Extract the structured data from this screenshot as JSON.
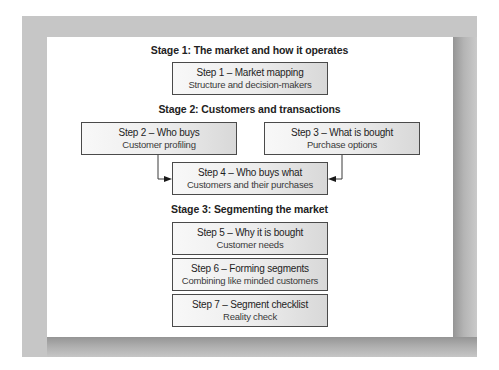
{
  "diagram": {
    "stages": [
      {
        "heading": "Stage 1:  The market and how it operates",
        "steps": [
          {
            "title": "Step 1 – Market mapping",
            "subtitle": "Structure and decision-makers"
          }
        ]
      },
      {
        "heading": "Stage 2:  Customers and transactions",
        "steps": [
          {
            "title": "Step 2 – Who buys",
            "subtitle": "Customer profiling"
          },
          {
            "title": "Step 3 – What is bought",
            "subtitle": "Purchase options"
          },
          {
            "title": "Step 4 – Who buys what",
            "subtitle": "Customers and their purchases"
          }
        ]
      },
      {
        "heading": "Stage 3:  Segmenting the market",
        "steps": [
          {
            "title": "Step 5 – Why it is bought",
            "subtitle": "Customer needs"
          },
          {
            "title": "Step 6 – Forming segments",
            "subtitle": "Combining like minded customers"
          },
          {
            "title": "Step 7 – Segment checklist",
            "subtitle": "Reality check"
          }
        ]
      }
    ],
    "connections": [
      {
        "from": "Step 2",
        "to": "Step 4"
      },
      {
        "from": "Step 3",
        "to": "Step 4"
      }
    ],
    "colors": {
      "frame": "#c6c6c6",
      "panel": "#ffffff",
      "box_border": "#4a4a4a",
      "box_fill_left": "#f8f8f8",
      "box_fill_right": "#d8d8d8",
      "text": "#222222"
    }
  }
}
